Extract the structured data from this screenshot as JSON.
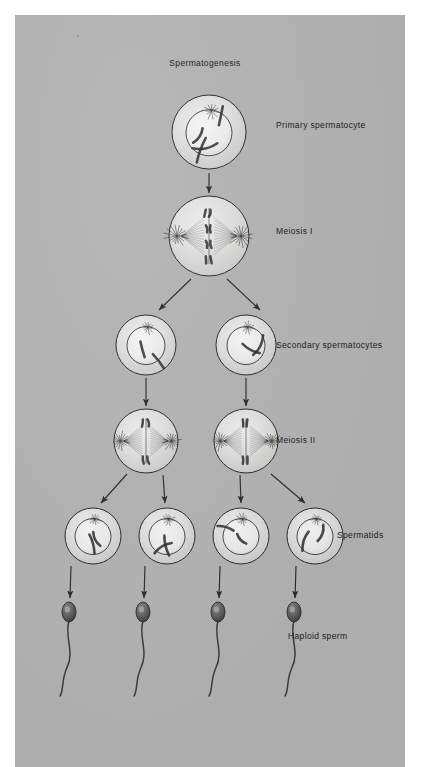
{
  "figure": {
    "title": "Spermatogenesis",
    "title_x": 190,
    "title_y": 48,
    "background_color": "#ffffff",
    "panel_color": "#b3b3b3",
    "ink_color": "#2b2b2b",
    "cell_fill_color": "#d9d9d9",
    "nucleus_fill_color": "#e8e8e8"
  },
  "labels": [
    {
      "id": "primary-spermatocyte",
      "text": "Primary spermatocyte",
      "x": 276,
      "y": 110
    },
    {
      "id": "meiosis-i",
      "text": "Meiosis I",
      "x": 276,
      "y": 216
    },
    {
      "id": "secondary-spermatocytes",
      "text": "Secondary spermatocytes",
      "x": 276,
      "y": 330
    },
    {
      "id": "meiosis-ii",
      "text": "Meiosis II",
      "x": 276,
      "y": 425
    },
    {
      "id": "spermatids",
      "text": "Spermatids",
      "x": 337,
      "y": 520
    },
    {
      "id": "haploid-sperm",
      "text": "Haploid sperm",
      "x": 288,
      "y": 621
    }
  ],
  "stages": [
    {
      "id": "primary-spermatocyte",
      "stage_label": "Primary spermatocyte",
      "row": 1,
      "cell_count": 1,
      "ploidy": "diploid",
      "cells": [
        {
          "cx": 194,
          "cy": 117,
          "r": 37,
          "nucleus_r": 23,
          "has_nucleus": true,
          "has_aster": true,
          "chromosomes": 4
        }
      ]
    },
    {
      "id": "meiosis-i",
      "stage_label": "Meiosis I",
      "row": 2,
      "cell_count": 1,
      "ploidy": "diploid",
      "cells": [
        {
          "cx": 194,
          "cy": 221,
          "r": 40,
          "has_nucleus": false,
          "has_spindle": true,
          "chromosomes": 4
        }
      ]
    },
    {
      "id": "secondary-spermatocytes",
      "stage_label": "Secondary spermatocytes",
      "row": 3,
      "cell_count": 2,
      "ploidy": "haploid",
      "cells": [
        {
          "cx": 131,
          "cy": 330,
          "r": 30,
          "nucleus_r": 19,
          "has_nucleus": true,
          "has_aster": true,
          "chromosomes": 2
        },
        {
          "cx": 231,
          "cy": 330,
          "r": 30,
          "nucleus_r": 19,
          "has_nucleus": true,
          "has_aster": true,
          "chromosomes": 2
        }
      ]
    },
    {
      "id": "meiosis-ii",
      "stage_label": "Meiosis II",
      "row": 4,
      "cell_count": 2,
      "ploidy": "haploid",
      "cells": [
        {
          "cx": 131,
          "cy": 426,
          "r": 32,
          "has_nucleus": false,
          "has_spindle": true,
          "chromosomes": 2
        },
        {
          "cx": 231,
          "cy": 426,
          "r": 32,
          "has_nucleus": false,
          "has_spindle": true,
          "chromosomes": 2
        }
      ]
    },
    {
      "id": "spermatids",
      "stage_label": "Spermatids",
      "row": 5,
      "cell_count": 4,
      "ploidy": "haploid",
      "cells": [
        {
          "cx": 78,
          "cy": 521,
          "r": 28,
          "nucleus_r": 18,
          "has_nucleus": true,
          "has_aster": true,
          "chromosomes": 2
        },
        {
          "cx": 152,
          "cy": 521,
          "r": 28,
          "nucleus_r": 18,
          "has_nucleus": true,
          "has_aster": true,
          "chromosomes": 2
        },
        {
          "cx": 226,
          "cy": 521,
          "r": 28,
          "nucleus_r": 18,
          "has_nucleus": true,
          "has_aster": true,
          "chromosomes": 2
        },
        {
          "cx": 300,
          "cy": 521,
          "r": 28,
          "nucleus_r": 18,
          "has_nucleus": true,
          "has_aster": true,
          "chromosomes": 2
        }
      ]
    },
    {
      "id": "haploid-sperm",
      "stage_label": "Haploid sperm",
      "row": 6,
      "cell_count": 4,
      "ploidy": "haploid",
      "cells": [
        {
          "cx": 54,
          "cy": 597,
          "head_rx": 7,
          "head_ry": 10,
          "tail_length": 84
        },
        {
          "cx": 128,
          "cy": 597,
          "head_rx": 7,
          "head_ry": 10,
          "tail_length": 84
        },
        {
          "cx": 203,
          "cy": 597,
          "head_rx": 7,
          "head_ry": 10,
          "tail_length": 84
        },
        {
          "cx": 279,
          "cy": 597,
          "head_rx": 7,
          "head_ry": 10,
          "tail_length": 84
        }
      ]
    }
  ],
  "arrows": [
    {
      "id": "arrow-primary-to-meiosis-i",
      "x1": 194,
      "y1": 158,
      "x2": 194,
      "y2": 178,
      "kind": "vertical"
    },
    {
      "id": "arrow-meiosis-i-to-secondary-left",
      "x1": 176,
      "y1": 264,
      "x2": 144,
      "y2": 295,
      "kind": "diagonal-left"
    },
    {
      "id": "arrow-meiosis-i-to-secondary-right",
      "x1": 212,
      "y1": 264,
      "x2": 245,
      "y2": 295,
      "kind": "diagonal-right"
    },
    {
      "id": "arrow-secondary-left-to-meiosis-ii",
      "x1": 131,
      "y1": 363,
      "x2": 131,
      "y2": 391,
      "kind": "vertical"
    },
    {
      "id": "arrow-secondary-right-to-meiosis-ii",
      "x1": 231,
      "y1": 363,
      "x2": 231,
      "y2": 391,
      "kind": "vertical"
    },
    {
      "id": "arrow-meiosis-ii-left-to-spermatid-1",
      "x1": 112,
      "y1": 459,
      "x2": 86,
      "y2": 488,
      "kind": "diagonal-left"
    },
    {
      "id": "arrow-meiosis-ii-left-to-spermatid-2",
      "x1": 148,
      "y1": 460,
      "x2": 150,
      "y2": 488,
      "kind": "vertical"
    },
    {
      "id": "arrow-meiosis-ii-right-to-spermatid-3",
      "x1": 225,
      "y1": 460,
      "x2": 226,
      "y2": 488,
      "kind": "vertical"
    },
    {
      "id": "arrow-meiosis-ii-right-to-spermatid-4",
      "x1": 256,
      "y1": 459,
      "x2": 290,
      "y2": 488,
      "kind": "diagonal-right"
    },
    {
      "id": "arrow-spermatid-1-to-sperm",
      "x1": 56,
      "y1": 551,
      "x2": 55,
      "y2": 583,
      "kind": "vertical"
    },
    {
      "id": "arrow-spermatid-2-to-sperm",
      "x1": 130,
      "y1": 551,
      "x2": 129,
      "y2": 583,
      "kind": "vertical"
    },
    {
      "id": "arrow-spermatid-3-to-sperm",
      "x1": 205,
      "y1": 551,
      "x2": 204,
      "y2": 583,
      "kind": "vertical"
    },
    {
      "id": "arrow-spermatid-4-to-sperm",
      "x1": 281,
      "y1": 551,
      "x2": 280,
      "y2": 583,
      "kind": "vertical"
    }
  ]
}
